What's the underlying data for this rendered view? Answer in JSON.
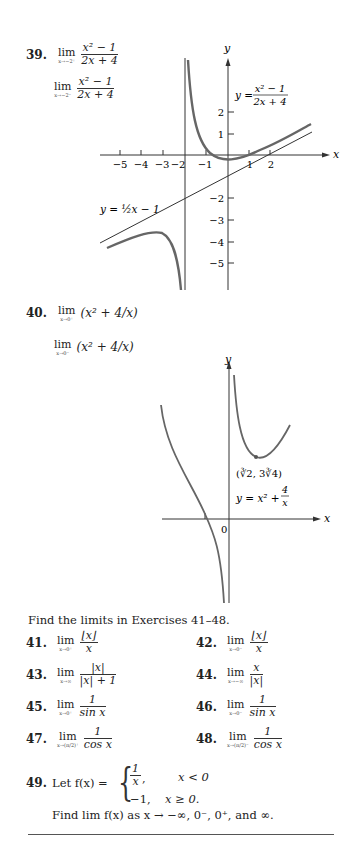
{
  "exercises_top": [
    {
      "number": "39.",
      "parts": [
        {
          "lim_sub": "x→−2⁺",
          "num": "x² − 1",
          "den": "2x + 4"
        },
        {
          "lim_sub": "x→−2⁻",
          "num": "x² − 1",
          "den": "2x + 4"
        }
      ]
    },
    {
      "number": "40.",
      "parts": [
        {
          "lim_sub": "x→0⁺",
          "expr": "(x² + 4/x)"
        },
        {
          "lim_sub": "x→0⁻",
          "expr": "(x² + 4/x)"
        }
      ]
    }
  ],
  "lim_word": "lim",
  "graph1": {
    "y_label": "y",
    "x_label": "x",
    "func_label_lhs": "y =",
    "func_num": "x² − 1",
    "func_den": "2x + 4",
    "asymptote_label": "y = ½x − 1",
    "x_ticks": [
      "−5",
      "−4",
      "−3",
      "−2",
      "−1",
      "1",
      "2"
    ],
    "y_ticks": [
      "2",
      "1",
      "−2",
      "−3",
      "−4",
      "−5"
    ]
  },
  "graph2": {
    "y_label": "y",
    "x_label": "x",
    "origin_label": "0",
    "min_point": "(∛2, 3∛4)",
    "func_label_lhs": "y = x² +",
    "func_num": "4",
    "func_den": "x"
  },
  "instructions": "Find the limits in Exercises 41–48.",
  "exercises": [
    {
      "number": "41.",
      "sub": "x→0⁺",
      "num": "⌊x⌋",
      "den": "x"
    },
    {
      "number": "42.",
      "sub": "x→0⁻",
      "num": "⌊x⌋",
      "den": "x"
    },
    {
      "number": "43.",
      "sub": "x→∞",
      "num": "|x|",
      "den": "|x| + 1"
    },
    {
      "number": "44.",
      "sub": "x→−∞",
      "num": "x",
      "den": "|x|"
    },
    {
      "number": "45.",
      "sub": "x→0⁺",
      "num": "1",
      "den": "sin x"
    },
    {
      "number": "46.",
      "sub": "x→0⁻",
      "num": "1",
      "den": "sin x"
    },
    {
      "number": "47.",
      "sub": "x→(π/2)⁺",
      "num": "1",
      "den": "cos x"
    },
    {
      "number": "48.",
      "sub": "x→(π/2)⁻",
      "num": "1",
      "den": "cos x"
    }
  ],
  "exercise49": {
    "number": "49.",
    "let": "Let f(x) =",
    "case1_num": "1",
    "case1_den": "x",
    "case1_cond": "x < 0",
    "case2_val": "−1,",
    "case2_cond": "x ≥ 0.",
    "find": "Find lim f(x) as x → −∞, 0⁻, 0⁺, and ∞."
  }
}
